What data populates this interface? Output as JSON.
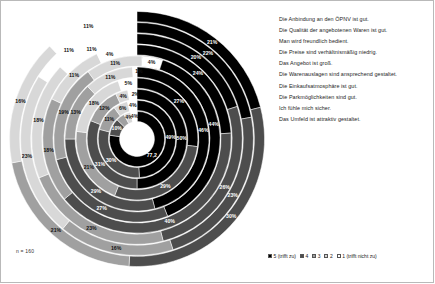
{
  "caption": {
    "n_label": "n = 160"
  },
  "statements": [
    {
      "id": 1,
      "label": "Die Anbindung an den ÖPNV ist gut."
    },
    {
      "id": 2,
      "label": "Die Qualität der angebotenen Waren ist gut."
    },
    {
      "id": 3,
      "label": "Man wird freundlich bedient."
    },
    {
      "id": 4,
      "label": "Die Preise sind verhältnismäßig niedrig."
    },
    {
      "id": 5,
      "label": "Das Angebot ist groß."
    },
    {
      "id": 6,
      "label": "Die Warenauslagen sind ansprechend gestaltet."
    },
    {
      "id": 7,
      "label": "Die Einkaufsatmosphäre ist gut."
    },
    {
      "id": 8,
      "label": "Die Parkmöglichkeiten sind gut."
    },
    {
      "id": 9,
      "label": "Ich fühle mich sicher."
    },
    {
      "id": 10,
      "label": "Das Umfeld ist attraktiv gestaltet."
    }
  ],
  "scale_legend": {
    "items": [
      {
        "key": "5",
        "label": "5 (trifft zu)",
        "color": "#000000"
      },
      {
        "key": "4",
        "label": "4",
        "color": "#4d4d4d"
      },
      {
        "key": "3",
        "label": "3",
        "color": "#a0a0a0"
      },
      {
        "key": "2",
        "label": "2",
        "color": "#d6d6d6"
      },
      {
        "key": "1",
        "label": "1 (trifft nicht zu)",
        "color": "#ffffff"
      }
    ]
  },
  "colors": {
    "cat5": "#000000",
    "cat4": "#4d4d4d",
    "cat3": "#a0a0a0",
    "cat2": "#d8d8d8",
    "cat1": "#ffffff",
    "ring_separator": "#ffffff",
    "background": "#ffffff",
    "border": "#b9b9b9"
  },
  "chart_data": {
    "type": "pie",
    "subtype": "concentric-stacked-radial",
    "title": "",
    "xlabel": "",
    "ylabel": "",
    "legend_position": "right + bottom",
    "grid": false,
    "n": 160,
    "categories": [
      "5 (trifft zu)",
      "4",
      "3",
      "2",
      "1 (trifft nicht zu)"
    ],
    "note": "Each ring is one statement; ring 1 = innermost = statement 1. Values are percent of respondents.",
    "rings": [
      {
        "ring": 1,
        "statement": "Die Anbindung an den ÖPNV ist gut.",
        "values": {
          "5": 77.2,
          "4": 10.0,
          "3": 5.0,
          "2": 4.0,
          "1": 4.0
        },
        "labels": [
          "77,2",
          "10%",
          "",
          "4%",
          "4%"
        ]
      },
      {
        "ring": 2,
        "statement": "Die Qualität der angebotenen Waren ist gut.",
        "values": {
          "5": 49.0,
          "4": 30.0,
          "3": 11.0,
          "2": 6.0,
          "1": 4.0
        },
        "labels": [
          "49%",
          "30%",
          "11%",
          "6%",
          "4%"
        ]
      },
      {
        "ring": 3,
        "statement": "Man wird freundlich bedient.",
        "values": {
          "5": 50.0,
          "4": 31.0,
          "3": 12.0,
          "2": 4.0,
          "1": 2.0
        },
        "labels": [
          "50%",
          "31%",
          "12%",
          "4%",
          "2%"
        ]
      },
      {
        "ring": 4,
        "statement": "Die Preise sind verhältnismäßig niedrig.",
        "values": {
          "5": 27.0,
          "4": 29.0,
          "3": 21.0,
          "2": 18.0,
          "1": 5.0
        },
        "labels": [
          "27%",
          "29%",
          "21%",
          "18%",
          "5%"
        ]
      },
      {
        "ring": 5,
        "statement": "Das Angebot ist groß.",
        "values": {
          "5": 46.0,
          "4": 29.0,
          "3": 13.0,
          "2": 11.0,
          "1": 1.0
        },
        "labels": [
          "46%",
          "29%",
          "13%",
          "11%",
          "1%"
        ]
      },
      {
        "ring": 6,
        "statement": "Die Warenauslagen sind ansprechend gestaltet.",
        "values": {
          "5": 44.0,
          "4": 27.0,
          "3": 19.0,
          "2": 11.0,
          "1": 4.0
        },
        "labels": [
          "44%",
          "27%",
          "19%",
          "11%",
          "4%"
        ]
      },
      {
        "ring": 7,
        "statement": "Die Einkaufsatmosphäre ist gut.",
        "values": {
          "5": 24.0,
          "4": 40.0,
          "3": 18.0,
          "2": 11.0,
          "1": 4.0
        },
        "labels": [
          "24%",
          "40%",
          "18%",
          "11%",
          "4%"
        ]
      },
      {
        "ring": 8,
        "statement": "Die Parkmöglichkeiten sind gut.",
        "values": {
          "5": 20.0,
          "4": 26.0,
          "3": 23.0,
          "2": 18.0,
          "1": 11.0
        },
        "labels": [
          "20%",
          "26%",
          "23%",
          "18%",
          "11%"
        ]
      },
      {
        "ring": 9,
        "statement": "Ich fühle mich sicher.",
        "values": {
          "5": 22.0,
          "4": 23.0,
          "3": 16.0,
          "2": 23.0,
          "1": 11.0
        },
        "labels": [
          "22%",
          "23%",
          "16%",
          "23%",
          "11%"
        ]
      },
      {
        "ring": 10,
        "statement": "Das Umfeld ist attraktiv gestaltet.",
        "values": {
          "5": 21.0,
          "4": 30.0,
          "3": 21.0,
          "2": 16.0,
          "1": 11.0
        },
        "labels": [
          "21%",
          "30%",
          "21%",
          "16%",
          "11%"
        ]
      }
    ]
  }
}
